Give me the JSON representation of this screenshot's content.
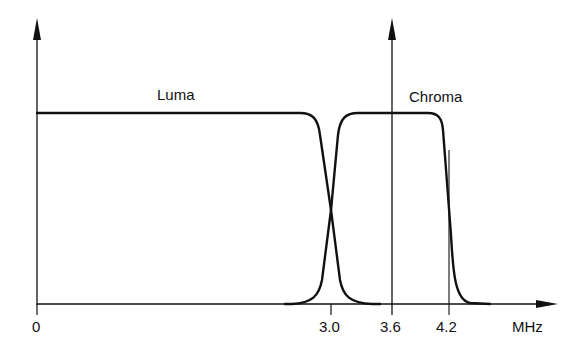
{
  "diagram": {
    "labels": {
      "luma": "Luma",
      "chroma": "Chroma"
    },
    "x_axis": {
      "unit": "MHz",
      "ticks": [
        {
          "value": "0"
        },
        {
          "value": "3.0"
        },
        {
          "value": "3.6"
        },
        {
          "value": "4.2"
        }
      ]
    },
    "colors": {
      "line": "#111111",
      "background": "#ffffff"
    }
  }
}
